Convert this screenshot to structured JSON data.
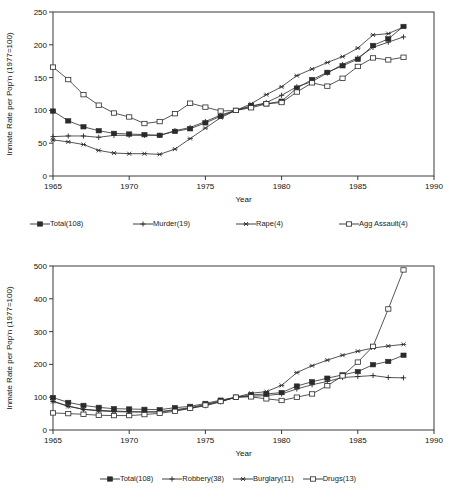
{
  "chart_data": [
    {
      "id": "violent-crimes",
      "type": "line",
      "title": "",
      "xlabel": "Year",
      "ylabel": "Inmate Rate per Pop'n (1977=100)",
      "xlim": [
        1965,
        1990
      ],
      "ylim": [
        0,
        250
      ],
      "xticks": [
        1965,
        1970,
        1975,
        1980,
        1985,
        1990
      ],
      "yticks": [
        0,
        50,
        100,
        150,
        200,
        250
      ],
      "grid": false,
      "legend_position": "below",
      "x": [
        1965,
        1966,
        1967,
        1968,
        1969,
        1970,
        1971,
        1972,
        1973,
        1974,
        1975,
        1976,
        1977,
        1978,
        1979,
        1980,
        1981,
        1982,
        1983,
        1984,
        1985,
        1986,
        1987,
        1988
      ],
      "series": [
        {
          "name": "Total(108)",
          "marker": "filled-square",
          "values": [
            99,
            84,
            75,
            69,
            65,
            64,
            63,
            62,
            68,
            72,
            81,
            91,
            100,
            107,
            110,
            114,
            134,
            147,
            158,
            168,
            178,
            199,
            209,
            228
          ]
        },
        {
          "name": "Murder(19)",
          "marker": "plus",
          "values": [
            60,
            61,
            61,
            59,
            62,
            62,
            62,
            62,
            69,
            74,
            83,
            93,
            100,
            106,
            112,
            123,
            136,
            144,
            157,
            170,
            180,
            196,
            204,
            212
          ]
        },
        {
          "name": "Rape(4)",
          "marker": "star",
          "values": [
            55,
            52,
            48,
            39,
            35,
            34,
            34,
            33,
            41,
            57,
            73,
            89,
            100,
            110,
            124,
            136,
            153,
            163,
            173,
            182,
            195,
            215,
            217,
            227
          ]
        },
        {
          "name": "Agg Assault(4)",
          "marker": "open-square",
          "values": [
            166,
            147,
            124,
            108,
            96,
            90,
            80,
            83,
            95,
            111,
            105,
            99,
            100,
            104,
            110,
            112,
            128,
            142,
            137,
            149,
            167,
            180,
            177,
            181
          ]
        }
      ]
    },
    {
      "id": "property-and-drug-crimes",
      "type": "line",
      "title": "",
      "xlabel": "Year",
      "ylabel": "Inmate Rate per Pop'n (1977=100)",
      "xlim": [
        1965,
        1990
      ],
      "ylim": [
        0,
        500
      ],
      "xticks": [
        1965,
        1970,
        1975,
        1980,
        1985,
        1990
      ],
      "yticks": [
        0,
        100,
        200,
        300,
        400,
        500
      ],
      "grid": false,
      "legend_position": "below",
      "x": [
        1965,
        1966,
        1967,
        1968,
        1969,
        1970,
        1971,
        1972,
        1973,
        1974,
        1975,
        1976,
        1977,
        1978,
        1979,
        1980,
        1981,
        1982,
        1983,
        1984,
        1985,
        1986,
        1987,
        1988
      ],
      "series": [
        {
          "name": "Total(108)",
          "marker": "filled-square",
          "values": [
            99,
            84,
            75,
            69,
            65,
            64,
            63,
            62,
            68,
            72,
            81,
            91,
            100,
            107,
            110,
            114,
            134,
            147,
            158,
            168,
            178,
            199,
            209,
            228
          ]
        },
        {
          "name": "Robbery(38)",
          "marker": "plus",
          "values": [
            88,
            73,
            63,
            58,
            56,
            55,
            55,
            55,
            60,
            66,
            74,
            86,
            100,
            103,
            105,
            110,
            125,
            138,
            148,
            160,
            163,
            166,
            160,
            159
          ]
        },
        {
          "name": "Burglary(11)",
          "marker": "star",
          "values": [
            87,
            72,
            63,
            60,
            58,
            56,
            55,
            56,
            62,
            68,
            78,
            88,
            100,
            112,
            117,
            136,
            175,
            196,
            213,
            228,
            240,
            250,
            256,
            261
          ]
        },
        {
          "name": "Drugs(13)",
          "marker": "open-square",
          "values": [
            52,
            50,
            48,
            45,
            44,
            44,
            47,
            51,
            57,
            66,
            76,
            87,
            100,
            101,
            95,
            90,
            100,
            110,
            135,
            165,
            207,
            255,
            369,
            488
          ]
        }
      ]
    }
  ],
  "top_chart": {
    "ylabel": "Inmate Rate per Pop'n (1977=100)",
    "xlabel": "Year",
    "yticks": [
      "250",
      "200",
      "150",
      "100",
      "50",
      "0"
    ],
    "xticks": [
      "1965",
      "1970",
      "1975",
      "1980",
      "1985",
      "1990"
    ],
    "legend": [
      {
        "label": "Total(108)",
        "marker": "filled-square"
      },
      {
        "label": "Murder(19)",
        "marker": "plus"
      },
      {
        "label": "Rape(4)",
        "marker": "star"
      },
      {
        "label": "Agg Assault(4)",
        "marker": "open-square"
      }
    ]
  },
  "bottom_chart": {
    "ylabel": "Inmate Rate per Pop'n (1977=100)",
    "xlabel": "Year",
    "yticks": [
      "500",
      "400",
      "300",
      "200",
      "100",
      "0"
    ],
    "xticks": [
      "1965",
      "1970",
      "1975",
      "1980",
      "1985",
      "1990"
    ],
    "legend": [
      {
        "label": "Total(108)",
        "marker": "filled-square"
      },
      {
        "label": "Robbery(38)",
        "marker": "plus"
      },
      {
        "label": "Burglary(11)",
        "marker": "star"
      },
      {
        "label": "Drugs(13)",
        "marker": "open-square"
      }
    ]
  },
  "colors": {
    "line": "#2b2b2b",
    "axis": "#3a3a3a",
    "text": "#111111",
    "background": "#ffffff"
  }
}
